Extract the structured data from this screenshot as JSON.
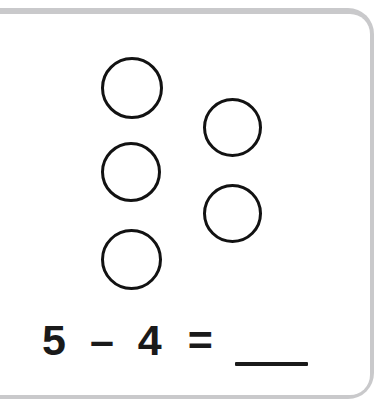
{
  "worksheet": {
    "background_color": "#ffffff",
    "frame_color": "#c9c9cb",
    "ink_color": "#1a1a1a"
  },
  "counters": {
    "label": "counter-circles",
    "total": 5,
    "stroke_color": "#121212",
    "items": [
      {
        "name": "counter-1",
        "x": 101,
        "y": 57,
        "size": 62
      },
      {
        "name": "counter-2",
        "x": 203,
        "y": 98,
        "size": 59
      },
      {
        "name": "counter-3",
        "x": 101,
        "y": 142,
        "size": 60
      },
      {
        "name": "counter-4",
        "x": 203,
        "y": 184,
        "size": 59
      },
      {
        "name": "counter-5",
        "x": 101,
        "y": 229,
        "size": 61
      }
    ]
  },
  "equation": {
    "minuend": "5",
    "operator": "–",
    "subtrahend": "4",
    "equals": "=",
    "answer": "",
    "answer_placeholder": "___",
    "full_text": "5 – 4 = ___"
  }
}
